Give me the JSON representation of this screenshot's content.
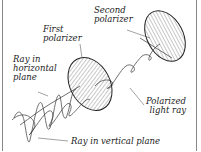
{
  "diagram": {
    "labels": {
      "second_polarizer": [
        "Second",
        "polarizer"
      ],
      "first_polarizer": [
        "First",
        "polarizer"
      ],
      "ray_horizontal": [
        "Ray in",
        "horizontal",
        "plane"
      ],
      "polarized_ray": [
        "Polarized",
        "light ray"
      ],
      "ray_vertical": "Ray in vertical plane"
    },
    "colors": {
      "line": "#333333",
      "border": "#888888",
      "background": "#ffffff"
    }
  }
}
